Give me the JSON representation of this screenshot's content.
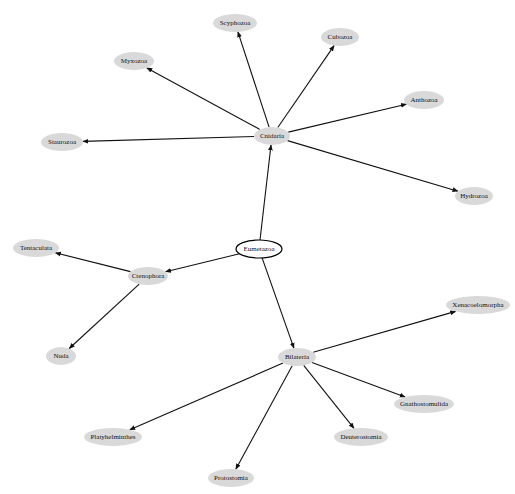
{
  "diagram": {
    "type": "directed-graph",
    "root": "Eumetazoa",
    "nodes": [
      {
        "id": "Eumetazoa",
        "label": "Eumetazoa",
        "x": 259,
        "y": 249,
        "rx": 23,
        "ry": 9,
        "style": "root"
      },
      {
        "id": "Cnidaria",
        "label": "Cnidaria",
        "x": 272,
        "y": 136,
        "rx": 18,
        "ry": 9,
        "style": "leaf"
      },
      {
        "id": "Ctenophora",
        "label": "Ctenophora",
        "x": 148,
        "y": 276,
        "rx": 20,
        "ry": 9,
        "style": "leaf"
      },
      {
        "id": "Bilateria",
        "label": "Bilateria",
        "x": 297,
        "y": 357,
        "rx": 19,
        "ry": 9,
        "style": "leaf"
      },
      {
        "id": "Scyphozoa",
        "label": "Scyphozoa",
        "x": 235,
        "y": 23,
        "rx": 22,
        "ry": 9,
        "style": "leaf"
      },
      {
        "id": "Cubozoa",
        "label": "Cubozoa",
        "x": 340,
        "y": 37,
        "rx": 19,
        "ry": 9,
        "style": "leaf"
      },
      {
        "id": "Myxozoa",
        "label": "Myxozoa",
        "x": 134,
        "y": 61,
        "rx": 20,
        "ry": 9,
        "style": "leaf"
      },
      {
        "id": "Anthozoa",
        "label": "Anthozoa",
        "x": 424,
        "y": 100,
        "rx": 20,
        "ry": 9,
        "style": "leaf"
      },
      {
        "id": "Staurozoa",
        "label": "Staurozoa",
        "x": 62,
        "y": 142,
        "rx": 21,
        "ry": 9,
        "style": "leaf"
      },
      {
        "id": "Hydrozoa",
        "label": "Hydrozoa",
        "x": 474,
        "y": 196,
        "rx": 19,
        "ry": 9,
        "style": "leaf"
      },
      {
        "id": "Tentaculata",
        "label": "Tentaculata",
        "x": 36,
        "y": 248,
        "rx": 23,
        "ry": 9,
        "style": "leaf"
      },
      {
        "id": "Nuda",
        "label": "Nuda",
        "x": 61,
        "y": 356,
        "rx": 15,
        "ry": 9,
        "style": "leaf"
      },
      {
        "id": "Xenacoelomorpha",
        "label": "Xenacoelomorpha",
        "x": 478,
        "y": 305,
        "rx": 32,
        "ry": 9,
        "style": "leaf"
      },
      {
        "id": "Gnathostomulida",
        "label": "Gnathostomulida",
        "x": 424,
        "y": 404,
        "rx": 30,
        "ry": 9,
        "style": "leaf"
      },
      {
        "id": "Platyhelminthes",
        "label": "Platyhelminthes",
        "x": 113,
        "y": 437,
        "rx": 29,
        "ry": 9,
        "style": "leaf"
      },
      {
        "id": "Deuterostomia",
        "label": "Deuterostomia",
        "x": 361,
        "y": 437,
        "rx": 27,
        "ry": 9,
        "style": "leaf"
      },
      {
        "id": "Protostomia",
        "label": "Protostomia",
        "x": 231,
        "y": 478,
        "rx": 23,
        "ry": 9,
        "style": "leaf"
      }
    ],
    "edges": [
      {
        "from": "Eumetazoa",
        "to": "Cnidaria"
      },
      {
        "from": "Eumetazoa",
        "to": "Ctenophora"
      },
      {
        "from": "Eumetazoa",
        "to": "Bilateria"
      },
      {
        "from": "Cnidaria",
        "to": "Scyphozoa"
      },
      {
        "from": "Cnidaria",
        "to": "Cubozoa"
      },
      {
        "from": "Cnidaria",
        "to": "Myxozoa"
      },
      {
        "from": "Cnidaria",
        "to": "Anthozoa"
      },
      {
        "from": "Cnidaria",
        "to": "Staurozoa"
      },
      {
        "from": "Cnidaria",
        "to": "Hydrozoa"
      },
      {
        "from": "Ctenophora",
        "to": "Tentaculata"
      },
      {
        "from": "Ctenophora",
        "to": "Nuda"
      },
      {
        "from": "Bilateria",
        "to": "Xenacoelomorpha"
      },
      {
        "from": "Bilateria",
        "to": "Gnathostomulida"
      },
      {
        "from": "Bilateria",
        "to": "Platyhelminthes"
      },
      {
        "from": "Bilateria",
        "to": "Deuterostomia"
      },
      {
        "from": "Bilateria",
        "to": "Protostomia"
      }
    ],
    "colors": {
      "leaf_fill": "#d9d9d9",
      "root_fill": "#ffffff",
      "root_stroke": "#000000",
      "edge": "#111111",
      "background": "#ffffff"
    }
  }
}
